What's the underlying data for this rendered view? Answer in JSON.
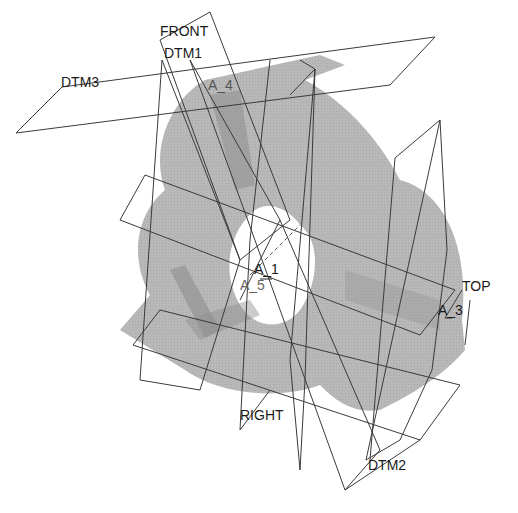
{
  "viewport": {
    "background": "#ffffff",
    "part_color": "#b4b4b4",
    "part_dark": "#8a8a8a",
    "plane_line_color": "#3a3a3a"
  },
  "datum_planes": {
    "front": "FRONT",
    "dtm1": "DTM1",
    "dtm3": "DTM3",
    "top": "TOP",
    "right": "RIGHT",
    "dtm2": "DTM2"
  },
  "axes": {
    "a4": "A_4",
    "a1": "A_1",
    "a5": "A_5",
    "a3": "A_3",
    "a1_prefix": "A",
    "a1_num": "1",
    "a5_num": "5",
    "a3_num": "3"
  }
}
